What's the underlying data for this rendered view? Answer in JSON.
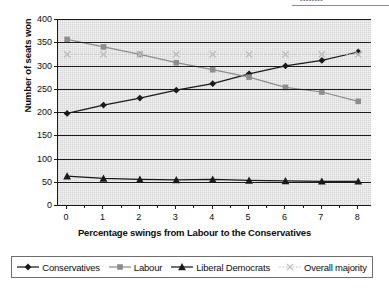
{
  "page": {
    "header_fragment": "▪▪▪▪▪▪▪▪"
  },
  "chart_data": {
    "type": "line",
    "title": "",
    "subtitle": "",
    "xlabel": "Percentage swings from Labour to the Conservatives",
    "ylabel": "Number of seats won",
    "x": [
      0,
      1,
      2,
      3,
      4,
      5,
      6,
      7,
      8
    ],
    "xtick_labels": [
      "0",
      "1",
      "2",
      "3",
      "4",
      "5",
      "6",
      "7",
      "8"
    ],
    "ytick_labels": [
      "400",
      "350",
      "300",
      "250",
      "200",
      "150",
      "100",
      "50",
      "0"
    ],
    "yticks": [
      400,
      350,
      300,
      250,
      200,
      150,
      100,
      50,
      0
    ],
    "xlim": [
      -0.25,
      8.35
    ],
    "ylim": [
      0,
      400
    ],
    "grid": "horizontal",
    "legend_position": "bottom",
    "series": [
      {
        "name": "Conservatives",
        "marker": "diamond",
        "color": "#1a1a1a",
        "values": [
          197,
          215,
          230,
          247,
          261,
          282,
          299,
          311,
          329
        ]
      },
      {
        "name": "Labour",
        "marker": "square",
        "color": "#8d8d8d",
        "values": [
          356,
          340,
          324,
          306,
          291,
          275,
          253,
          243,
          223
        ]
      },
      {
        "name": "Liberal Democrats",
        "marker": "triangle",
        "color": "#1a1a1a",
        "values": [
          62,
          57,
          55,
          54,
          55,
          53,
          52,
          51,
          51
        ]
      },
      {
        "name": "Overall majority",
        "marker": "cross",
        "color": "#bdbdbd",
        "values": [
          324,
          324,
          324,
          324,
          324,
          324,
          324,
          324,
          324
        ]
      }
    ]
  },
  "legend": {
    "items": [
      {
        "label": "Conservatives"
      },
      {
        "label": "Labour"
      },
      {
        "label": "Liberal Democrats"
      },
      {
        "label": "Overall majority"
      }
    ]
  }
}
